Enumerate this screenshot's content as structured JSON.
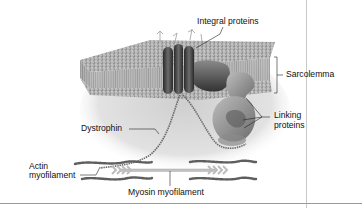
{
  "figure": {
    "labels": {
      "integral_proteins": "Integral proteins",
      "sarcolemma": "Sarcolemma",
      "linking_proteins_line1": "Linking",
      "linking_proteins_line2": "proteins",
      "dystrophin": "Dystrophin",
      "actin_line1": "Actin",
      "actin_line2": "myofilament",
      "myosin": "Myosin myofilament"
    },
    "colors": {
      "background": "#ffffff",
      "membrane_bead": "#8c8c8c",
      "protein_dark": "#3a3a3a",
      "shadow_gray": "#d4d4d4",
      "label_text": "#111111"
    }
  }
}
